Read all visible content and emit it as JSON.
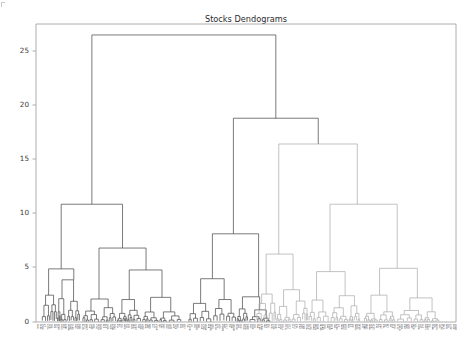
{
  "figure": {
    "width": 475,
    "height": 361,
    "background": "#ffffff"
  },
  "chart_data": {
    "type": "line",
    "subtype": "dendrogram",
    "title": "Stocks Dendograms",
    "xlabel": "",
    "ylabel": "",
    "ylim": [
      0,
      27.2
    ],
    "xlim": [
      0,
      1
    ],
    "grid": false,
    "legend": false,
    "orientation": "top",
    "yticks": [
      0,
      5,
      10,
      15,
      20,
      25
    ],
    "ytick_labels": [
      "0",
      "5",
      "10",
      "15",
      "20",
      "25"
    ],
    "xtick_labels_note": "dense rotated stock ticker leaf labels, unreadable at this resolution",
    "leaf_count": 180,
    "colors": {
      "above_threshold": "#4f4f4f",
      "cluster_1": "#4f4f4f",
      "cluster_2": "#a9a9a9",
      "axis": "#9a9a9a",
      "text": "#2b2b2b"
    },
    "color_threshold": 10.9,
    "root_height": 26.2,
    "links": [
      {
        "x1": 0.133,
        "x2": 0.571,
        "h": 26.2,
        "h1": 10.75,
        "h2": 18.6,
        "color": "#4f4f4f"
      },
      {
        "x1": 0.47,
        "x2": 0.672,
        "h": 18.6,
        "h1": 8.05,
        "h2": 16.25,
        "color": "#4f4f4f"
      },
      {
        "x1": 0.133,
        "x2": 0.133,
        "h": 10.75,
        "h1": 4.85,
        "h2": 6.75,
        "color": "#4f4f4f"
      },
      {
        "x1": 0.06,
        "x2": 0.206,
        "h": 10.75,
        "h1": 4.85,
        "h2": 6.75,
        "color": "#4f4f4f"
      },
      {
        "x1": 0.06,
        "x2": 0.06,
        "h": 4.85,
        "h1": 2.45,
        "h2": 3.85,
        "color": "#4f4f4f"
      },
      {
        "x1": 0.206,
        "x2": 0.206,
        "h": 6.75,
        "h1": 2.1,
        "h2": 4.75,
        "color": "#4f4f4f"
      },
      {
        "x1": 0.578,
        "x2": 0.765,
        "h": 16.25,
        "h1": 6.2,
        "h2": 10.75,
        "color": "#a9a9a9"
      },
      {
        "x1": 0.672,
        "x2": 0.672,
        "h": 16.25,
        "h1": 6.2,
        "h2": 10.75,
        "color": "#a9a9a9"
      },
      {
        "x1": 0.7,
        "x2": 0.86,
        "h": 10.75,
        "h1": 4.6,
        "h2": 4.9,
        "color": "#a9a9a9"
      },
      {
        "x1": 0.42,
        "x2": 0.53,
        "h": 8.05,
        "h1": 3.95,
        "h2": 2.3,
        "color": "#4f4f4f"
      }
    ],
    "branch_summary": [
      {
        "label": "root",
        "merge_height": 26.2,
        "n_children": 2
      },
      {
        "label": "left-cluster",
        "merge_height": 10.75,
        "color": "#4f4f4f"
      },
      {
        "label": "right-upper-cluster",
        "merge_height": 18.6,
        "color": "#4f4f4f"
      },
      {
        "label": "right-light-cluster",
        "merge_height": 16.25,
        "color": "#a9a9a9"
      },
      {
        "label": "mid-cluster",
        "merge_height": 8.05,
        "color": "#4f4f4f"
      },
      {
        "label": "right-sub-cluster",
        "merge_height": 10.75,
        "color": "#a9a9a9"
      }
    ]
  },
  "axes": {
    "plot_left": 36,
    "plot_right": 456,
    "plot_top": 24,
    "plot_bottom": 322
  }
}
